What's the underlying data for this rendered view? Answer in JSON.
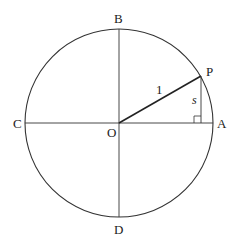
{
  "diagram": {
    "type": "unit-circle",
    "colors": {
      "stroke": "#333333",
      "text": "#222222",
      "background": "#ffffff"
    },
    "labels": {
      "A": "A",
      "B": "B",
      "C": "C",
      "D": "D",
      "O": "O",
      "P": "P",
      "radius": "1",
      "side": "s"
    },
    "geometry": {
      "center": [
        119,
        123
      ],
      "radius": 94,
      "P": [
        201,
        76
      ],
      "foot": [
        201,
        123
      ],
      "right_angle_size": 7
    }
  }
}
